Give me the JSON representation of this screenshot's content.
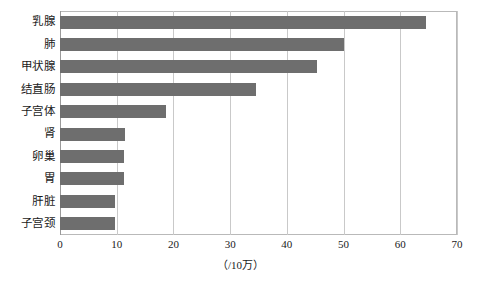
{
  "chart_data": {
    "type": "bar",
    "orientation": "horizontal",
    "title": "",
    "subtitle": "",
    "xlabel": "（/10万）",
    "ylabel": "",
    "xlim": [
      0,
      70
    ],
    "xticks": [
      0,
      10,
      20,
      30,
      40,
      50,
      60,
      70
    ],
    "xtick_labels": [
      "0",
      "10",
      "20",
      "30",
      "40",
      "50",
      "60",
      "70"
    ],
    "grid": "vertical",
    "legend": "none",
    "bar_color": "#6e6e6e",
    "categories": [
      "乳腺",
      "肺",
      "甲状腺",
      "结直肠",
      "子宫体",
      "肾",
      "卵巢",
      "胃",
      "肝脏",
      "子宫颈"
    ],
    "values": [
      64.5,
      50.0,
      45.3,
      34.6,
      18.7,
      11.5,
      11.3,
      11.3,
      9.7,
      9.7
    ],
    "bars": [
      {
        "label": "乳腺",
        "value": 64.5
      },
      {
        "label": "肺",
        "value": 50.0
      },
      {
        "label": "甲状腺",
        "value": 45.3
      },
      {
        "label": "结直肠",
        "value": 34.6
      },
      {
        "label": "子宫体",
        "value": 18.7
      },
      {
        "label": "肾",
        "value": 11.5
      },
      {
        "label": "卵巢",
        "value": 11.3
      },
      {
        "label": "胃",
        "value": 11.3
      },
      {
        "label": "肝脏",
        "value": 9.7
      },
      {
        "label": "子宫颈",
        "value": 9.7
      }
    ]
  }
}
